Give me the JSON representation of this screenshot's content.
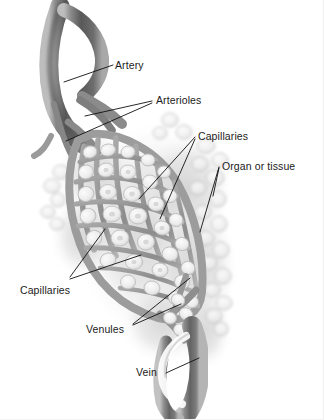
{
  "figure": {
    "background_color": "#ffffff",
    "ink_color": "#111111",
    "vessel_dark": "#5a5a5a",
    "vessel_mid": "#8f8f8f",
    "vessel_light": "#c9c9c9",
    "tissue_fill": "#e9e9e9",
    "cell_fill": "#f4f4f4"
  },
  "labels": {
    "artery": "Artery",
    "arterioles": "Arterioles",
    "capillaries_top": "Capillaries",
    "organ_or_tissue": "Organ or tissue",
    "capillaries_bottom": "Capillaries",
    "venules": "Venules",
    "vein": "Vein"
  },
  "label_positions": {
    "artery": {
      "x": 115,
      "y": 69
    },
    "arterioles": {
      "x": 156,
      "y": 104
    },
    "capillaries_top": {
      "x": 198,
      "y": 140
    },
    "organ_or_tissue": {
      "x": 222,
      "y": 170
    },
    "capillaries_bottom": {
      "x": 20,
      "y": 294
    },
    "venules": {
      "x": 86,
      "y": 333
    },
    "vein": {
      "x": 136,
      "y": 376
    }
  },
  "leader_lines": {
    "artery": [
      [
        [
          113,
          65
        ],
        [
          64,
          82
        ]
      ]
    ],
    "arterioles": [
      [
        [
          152,
          101
        ],
        [
          85,
          116
        ]
      ],
      [
        [
          152,
          103
        ],
        [
          66,
          141
        ]
      ]
    ],
    "capillaries_top": [
      [
        [
          195,
          137
        ],
        [
          139,
          199
        ]
      ],
      [
        [
          195,
          139
        ],
        [
          160,
          219
        ]
      ]
    ],
    "organ_or_tissue": [
      [
        [
          219,
          167
        ],
        [
          200,
          232
        ]
      ],
      [
        [
          219,
          168
        ],
        [
          213,
          196
        ]
      ]
    ],
    "capillaries_bottom": [
      [
        [
          70,
          277
        ],
        [
          105,
          229
        ]
      ],
      [
        [
          70,
          279
        ],
        [
          141,
          255
        ]
      ]
    ],
    "venules": [
      [
        [
          133,
          324
        ],
        [
          190,
          278
        ]
      ],
      [
        [
          133,
          325
        ],
        [
          181,
          304
        ]
      ]
    ],
    "vein": [
      [
        [
          166,
          373
        ],
        [
          199,
          358
        ]
      ]
    ]
  },
  "anatomy": {
    "artery_note": "Thick dark vessel entering from top-left, curving down-right",
    "vein_note": "Thick vessel exiting at bottom-center, curving down",
    "capillary_bed_note": "Mesh of narrow vessels enclosing pale tissue cells",
    "tissue_note": "Diffuse gray cellular mass surrounding the vessel network"
  }
}
